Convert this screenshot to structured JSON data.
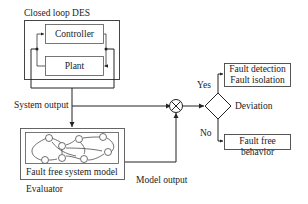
{
  "diagram": {
    "closed_loop": {
      "label": "Closed loop DES",
      "controller": "Controller",
      "plant": "Plant"
    },
    "system_output_label": "System output",
    "evaluator": {
      "label": "Evaluator",
      "model_label": "Fault free system model"
    },
    "model_output_label": "Model output",
    "comparator": "comparator-circle",
    "decision": {
      "label": "Deviation",
      "yes": "Yes",
      "no": "No"
    },
    "outcomes": {
      "fault_line1": "Fault detection",
      "fault_line2": "Fault isolation",
      "no_fault": "Fault free behavior"
    },
    "colors": {
      "line": "#222222",
      "box_border": "#444444",
      "background": "#ffffff"
    }
  }
}
